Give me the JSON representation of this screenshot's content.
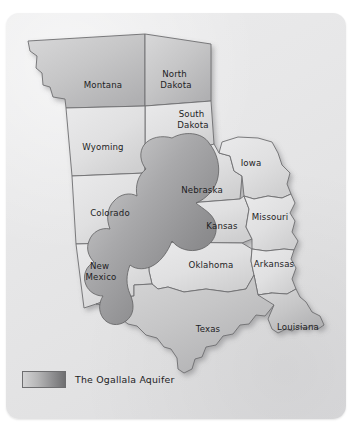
{
  "figure": {
    "title": "The Ogallala Aquifer",
    "background_color": "#ffffff",
    "panel_color": "#e7e7e8"
  },
  "legend": {
    "label": "The Ogallala Aquifer",
    "swatch_gradient_from": "#d3d3d4",
    "swatch_gradient_to": "#6f6f71",
    "swatch_border_color": "#6e6e70"
  },
  "map": {
    "type": "choropleth-overlay",
    "region": "United States Great Plains",
    "state_border_color": "#6e6e70",
    "state_fill_light": "#e4e4e5",
    "state_fill_dark": "#b9b9ba",
    "aquifer_fill_light": "#cbcbcc",
    "aquifer_fill_dark": "#8a8a8c",
    "states": [
      {
        "name": "Montana",
        "label": "Montana",
        "label_x": 97,
        "label_y": 72,
        "shade": "mid"
      },
      {
        "name": "North Dakota",
        "label_line1": "North",
        "label_line2": "Dakota",
        "label_x": 170,
        "label_y": 68,
        "shade": "mid"
      },
      {
        "name": "South Dakota",
        "label_line1": "South",
        "label_line2": "Dakota",
        "label_x": 187,
        "label_y": 108,
        "shade": "light"
      },
      {
        "name": "Wyoming",
        "label": "Wyoming",
        "label_x": 97,
        "label_y": 136,
        "shade": "light"
      },
      {
        "name": "Iowa",
        "label": "Iowa",
        "label_x": 243,
        "label_y": 152,
        "shade": "light"
      },
      {
        "name": "Nebraska",
        "label": "Nebraska",
        "label_x": 196,
        "label_y": 180,
        "shade": "light"
      },
      {
        "name": "Colorado",
        "label": "Colorado",
        "label_x": 105,
        "label_y": 205,
        "shade": "light"
      },
      {
        "name": "Missouri",
        "label": "Missouri",
        "label_x": 262,
        "label_y": 207,
        "shade": "light"
      },
      {
        "name": "Kansas",
        "label": "Kansas",
        "label_x": 217,
        "label_y": 218,
        "shade": "light"
      },
      {
        "name": "Oklahoma",
        "label": "Oklahoma",
        "label_x": 206,
        "label_y": 258,
        "shade": "light"
      },
      {
        "name": "Arkansas",
        "label": "Arkansas",
        "label_x": 268,
        "label_y": 256,
        "shade": "light"
      },
      {
        "name": "New Mexico",
        "label_line1": "New",
        "label_line2": "Mexico",
        "label_x": 95,
        "label_y": 262,
        "shade": "light"
      },
      {
        "name": "Texas",
        "label": "Texas",
        "label_x": 203,
        "label_y": 322,
        "shade": "mid"
      },
      {
        "name": "Louisiana",
        "label": "Louisiana",
        "label_x": 292,
        "label_y": 320,
        "shade": "mid"
      }
    ],
    "aquifer": {
      "name": "Ogallala Aquifer",
      "spans_states": [
        "South Dakota",
        "Nebraska",
        "Wyoming",
        "Colorado",
        "Kansas",
        "Oklahoma",
        "New Mexico",
        "Texas"
      ]
    }
  }
}
